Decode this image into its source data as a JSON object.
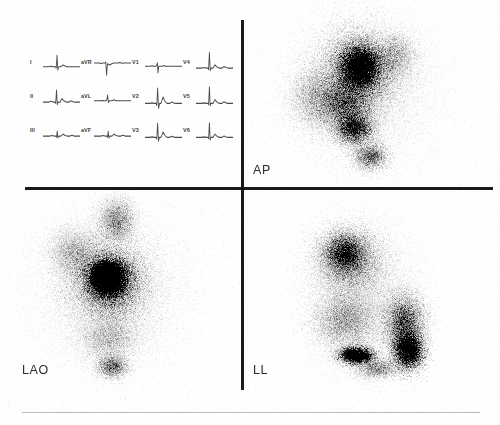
{
  "figure": {
    "modality": "nuclear-medicine-scintigraphy",
    "background_color": "#fefefe",
    "line_color": "#1a1a1a",
    "footer_rule_color": "#b9b9b9"
  },
  "views": {
    "ap": {
      "label": "AP",
      "name": "anterior-posterior"
    },
    "lao": {
      "label": "LAO",
      "name": "left-anterior-oblique"
    },
    "ll": {
      "label": "LL",
      "name": "left-lateral"
    }
  },
  "ecg": {
    "panel_name": "12-lead-electrocardiogram",
    "rows": [
      [
        {
          "lead": "I",
          "trace": "M0,14 L6,14 L8,13.6 L10,14 L12.5,14 L13.2,15 L14,5 L14.8,16.5 L15.6,14 L18,14 L20,12.6 L22,13.4 L24,14 L37,14"
        },
        {
          "lead": "aVR",
          "trace": "M0,11 L5,11 L7,11.4 L9,11 L11,11 L11.8,10.4 L12.6,20.5 L13.4,11.6 L16,12.6 L18,11.4 L20,11 L24,11 L26,10.6 L28,11.2 L30,11 L37,11"
        },
        {
          "lead": "V1",
          "trace": "M0,13.5 L5,13.5 L7,13.1 L9,13.5 L11,13.5 L11.8,12.2 L12.4,10.8 L13.0,18.8 L13.8,13.5 L17,13.5 L19,12.9 L21,13.7 L23,13.5 L37,13.5"
        },
        {
          "lead": "V4",
          "trace": "M0,15 L6,15 L8,14.6 L10,15 L12,15 L12.6,16.2 L13.4,2.5 L14.2,17 L15,15 L17,15 L19,12.4 L21,14.2 L23,15 L26,15 L28,13.8 L30,14.6 L32,15 L37,15"
        }
      ],
      [
        {
          "lead": "II",
          "trace": "M0,15 L6,15 L8,14.4 L10,15 L12,15 L12.7,16 L13.5,5.5 L14.3,17 L15.2,15 L17,15 L19,12.2 L21,14 L23,15 L26,15 L28,14 L30,14.8 L32,15 L37,15"
        },
        {
          "lead": "aVL",
          "trace": "M0,14 L6,14 L8,13.7 L10,14 L12,14 L12.8,13.2 L13.6,9.5 L14.4,15.4 L15.2,14 L18,14 L20,13.2 L22,14 L24,14 L37,14"
        },
        {
          "lead": "V2",
          "trace": "M0,16 L5,16 L7,15.6 L9,16 L11,16 L11.8,17.6 L12.6,4 L13.6,20 L14.6,16 L16,16 L18,11 L20,14.4 L22,16 L25,16 L27,15 L29,15.8 L31,16 L37,16"
        },
        {
          "lead": "V5",
          "trace": "M0,16 L6,16 L8,15.6 L10,16 L12,16 L12.6,17 L13.4,3 L14.2,18 L15,16 L17,16 L19,13 L21,15 L23,16 L26,16 L28,14.8 L30,15.6 L32,16 L37,16"
        }
      ],
      [
        {
          "lead": "III",
          "trace": "M0,15 L7,15 L9,14.6 L11,15 L13,15 L13.6,15.8 L14.2,11 L14.9,16.4 L15.7,15 L18,15 L20,13.4 L22,14.6 L24,15 L27,15 L29,14.4 L31,15 L37,15"
        },
        {
          "lead": "aVF",
          "trace": "M0,15 L7,15 L9,14.6 L11,15 L13,15 L13.6,15.8 L14.2,11.2 L14.9,16.4 L15.7,15 L18,15 L20,13.4 L22,14.6 L24,15 L27,15 L29,14.4 L31,15 L37,15"
        },
        {
          "lead": "V3",
          "trace": "M0,16 L5,16 L7,15.6 L9,16 L11,16 L11.8,17.2 L12.6,5 L13.5,19 L14.4,16 L16,16 L18,11.8 L20,14.6 L22,16 L25,16 L27,15.2 L29,15.8 L31,16 L37,16"
        },
        {
          "lead": "V6",
          "trace": "M0,16 L6,16 L8,15.6 L10,16 L12,16 L12.6,17 L13.4,4.5 L14.2,18 L15,16 L17,16 L19,13.4 L21,15.2 L23,16 L26,16 L28,15 L30,15.7 L32,16 L37,16"
        }
      ]
    ]
  },
  "scans": [
    {
      "id": "ap",
      "width": 256,
      "height": 187,
      "seed": 1471,
      "points": 62000,
      "blobs": [
        {
          "cx": 118,
          "cy": 88,
          "rx": 74,
          "ry": 82,
          "w": 1.0,
          "dens": 0.3
        },
        {
          "cx": 112,
          "cy": 72,
          "rx": 42,
          "ry": 46,
          "w": 0.95,
          "dens": 0.62
        },
        {
          "cx": 116,
          "cy": 66,
          "rx": 24,
          "ry": 26,
          "w": 0.7,
          "dens": 0.92
        },
        {
          "cx": 98,
          "cy": 104,
          "rx": 34,
          "ry": 30,
          "w": 0.6,
          "dens": 0.58
        },
        {
          "cx": 110,
          "cy": 128,
          "rx": 22,
          "ry": 20,
          "w": 0.42,
          "dens": 0.72
        },
        {
          "cx": 126,
          "cy": 156,
          "rx": 20,
          "ry": 16,
          "w": 0.26,
          "dens": 0.5
        },
        {
          "cx": 70,
          "cy": 96,
          "rx": 30,
          "ry": 36,
          "w": 0.4,
          "dens": 0.34
        },
        {
          "cx": 150,
          "cy": 56,
          "rx": 26,
          "ry": 28,
          "w": 0.34,
          "dens": 0.38
        }
      ]
    },
    {
      "id": "lao",
      "width": 241,
      "height": 222,
      "seed": 2239,
      "points": 64000,
      "blobs": [
        {
          "cx": 110,
          "cy": 100,
          "rx": 78,
          "ry": 80,
          "w": 1.0,
          "dens": 0.3
        },
        {
          "cx": 108,
          "cy": 92,
          "rx": 44,
          "ry": 44,
          "w": 0.95,
          "dens": 0.62
        },
        {
          "cx": 108,
          "cy": 88,
          "rx": 24,
          "ry": 24,
          "w": 0.85,
          "dens": 1.0
        },
        {
          "cx": 106,
          "cy": 86,
          "rx": 13,
          "ry": 13,
          "w": 0.55,
          "dens": 1.0
        },
        {
          "cx": 116,
          "cy": 30,
          "rx": 22,
          "ry": 26,
          "w": 0.4,
          "dens": 0.42
        },
        {
          "cx": 74,
          "cy": 62,
          "rx": 30,
          "ry": 30,
          "w": 0.42,
          "dens": 0.36
        },
        {
          "cx": 108,
          "cy": 148,
          "rx": 34,
          "ry": 26,
          "w": 0.38,
          "dens": 0.34
        },
        {
          "cx": 112,
          "cy": 176,
          "rx": 18,
          "ry": 14,
          "w": 0.22,
          "dens": 0.46
        }
      ]
    },
    {
      "id": "ll",
      "width": 256,
      "height": 222,
      "seed": 3307,
      "points": 60000,
      "blobs": [
        {
          "cx": 120,
          "cy": 108,
          "rx": 62,
          "ry": 78,
          "w": 0.95,
          "dens": 0.26
        },
        {
          "cx": 104,
          "cy": 70,
          "rx": 40,
          "ry": 38,
          "w": 0.9,
          "dens": 0.5
        },
        {
          "cx": 100,
          "cy": 62,
          "rx": 24,
          "ry": 22,
          "w": 0.5,
          "dens": 0.62
        },
        {
          "cx": 100,
          "cy": 130,
          "rx": 36,
          "ry": 34,
          "w": 0.7,
          "dens": 0.42
        },
        {
          "cx": 160,
          "cy": 132,
          "rx": 24,
          "ry": 34,
          "w": 0.72,
          "dens": 0.58
        },
        {
          "cx": 164,
          "cy": 160,
          "rx": 18,
          "ry": 22,
          "w": 0.6,
          "dens": 0.9
        },
        {
          "cx": 112,
          "cy": 165,
          "rx": 20,
          "ry": 10,
          "w": 0.42,
          "dens": 0.85
        },
        {
          "cx": 132,
          "cy": 178,
          "rx": 26,
          "ry": 12,
          "w": 0.26,
          "dens": 0.4
        }
      ]
    }
  ]
}
